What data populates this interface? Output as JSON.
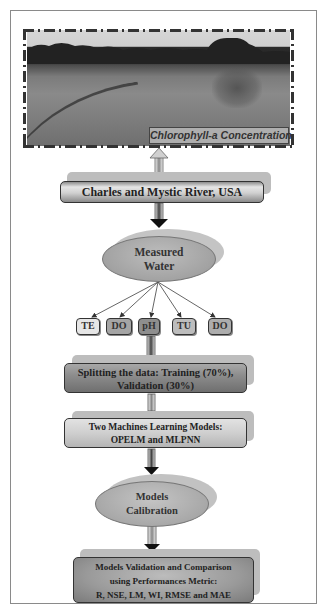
{
  "diagram": {
    "type": "flowchart",
    "photo": {
      "description": "grayscale photo of river shoreline with trees",
      "caption": "Chlorophyll-a Concentration"
    },
    "nodes": {
      "location": "Charles and Mystic River, USA",
      "measured_water": {
        "line1": "Measured",
        "line2": "Water"
      },
      "variables": [
        "TE",
        "DO",
        "pH",
        "TU",
        "DO"
      ],
      "splitting": {
        "line1": "Splitting the data: Training (70%),",
        "line2": "Validation (30%)"
      },
      "models": {
        "line1": "Two Machines Learning Models:",
        "line2": "OPELM and MLPNN"
      },
      "calibration": {
        "line1": "Models",
        "line2": "Calibration"
      },
      "validation": {
        "line1": "Models Validation and Comparison",
        "line2": "using Performances Metric:",
        "line3": "R, NSE, LM, WI, RMSE and MAE"
      }
    },
    "icons": {
      "up_arrow": "arrow-up-icon",
      "down_arrow": "arrow-down-icon"
    },
    "colors": {
      "box_dark": "#7a7a7a",
      "box_light": "#d0d0d0",
      "ellipse": "#a9a9a9",
      "border": "#333333"
    }
  }
}
